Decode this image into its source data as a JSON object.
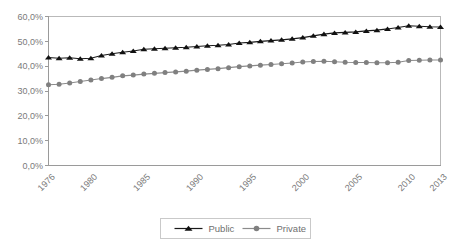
{
  "chart_data": {
    "type": "line",
    "title": "",
    "subtitle": "",
    "xlabel": "",
    "ylabel": "",
    "xlim": [
      1976,
      2013
    ],
    "ylim": [
      0,
      60
    ],
    "grid": false,
    "legend_position": "bottom",
    "x": [
      1976,
      1977,
      1978,
      1979,
      1980,
      1981,
      1982,
      1983,
      1984,
      1985,
      1986,
      1987,
      1988,
      1989,
      1990,
      1991,
      1992,
      1993,
      1994,
      1995,
      1996,
      1997,
      1998,
      1999,
      2000,
      2001,
      2002,
      2003,
      2004,
      2005,
      2006,
      2007,
      2008,
      2009,
      2010,
      2011,
      2012,
      2013
    ],
    "xtick_labels": [
      "1976",
      "1980",
      "1985",
      "1990",
      "1995",
      "2000",
      "2005",
      "2010",
      "2013"
    ],
    "xtick_values": [
      1976,
      1980,
      1985,
      1990,
      1995,
      2000,
      2005,
      2010,
      2013
    ],
    "ytick_labels": [
      "0,0%",
      "10,0%",
      "20,0%",
      "30,0%",
      "40,0%",
      "50,0%",
      "60,0%"
    ],
    "ytick_values": [
      0,
      10,
      20,
      30,
      40,
      50,
      60
    ],
    "series": [
      {
        "name": "Public",
        "marker": "triangle",
        "color": "#111111",
        "values": [
          43.5,
          43.2,
          43.4,
          43.0,
          43.2,
          44.3,
          45.0,
          45.6,
          46.1,
          46.8,
          47.0,
          47.2,
          47.4,
          47.6,
          47.9,
          48.2,
          48.4,
          48.7,
          49.3,
          49.6,
          50.0,
          50.3,
          50.6,
          51.0,
          51.5,
          52.2,
          52.9,
          53.4,
          53.6,
          53.8,
          54.2,
          54.5,
          55.0,
          55.6,
          56.3,
          56.1,
          55.9,
          55.8
        ]
      },
      {
        "name": "Private",
        "marker": "circle",
        "color": "#808080",
        "values": [
          32.5,
          32.7,
          33.2,
          33.8,
          34.4,
          35.0,
          35.5,
          36.1,
          36.4,
          36.8,
          37.1,
          37.4,
          37.7,
          38.0,
          38.4,
          38.7,
          39.0,
          39.4,
          39.8,
          40.1,
          40.4,
          40.7,
          41.0,
          41.3,
          41.7,
          41.9,
          42.0,
          41.8,
          41.6,
          41.5,
          41.5,
          41.4,
          41.4,
          41.6,
          42.3,
          42.4,
          42.5,
          42.5
        ]
      }
    ]
  },
  "legend": {
    "items": [
      {
        "label": "Public"
      },
      {
        "label": "Private"
      }
    ]
  }
}
